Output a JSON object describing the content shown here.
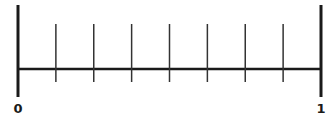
{
  "diagram": {
    "type": "number-line",
    "start_label": "0",
    "end_label": "1",
    "intervals": 8,
    "minor_tick_count": 7,
    "line_color": "#1a1a1a",
    "tick_color": "#333333"
  }
}
